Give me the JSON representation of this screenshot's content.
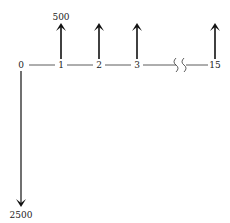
{
  "diagram": {
    "type": "cash-flow timeline",
    "periods": [
      {
        "label": "0",
        "x": 21
      },
      {
        "label": "1",
        "x": 61
      },
      {
        "label": "2",
        "x": 99
      },
      {
        "label": "3",
        "x": 137
      },
      {
        "label": "15",
        "x": 215
      }
    ],
    "inflows": [
      {
        "period": "1",
        "x": 61,
        "amount_label": "500"
      },
      {
        "period": "2",
        "x": 99,
        "amount_label": ""
      },
      {
        "period": "3",
        "x": 137,
        "amount_label": ""
      },
      {
        "period": "15",
        "x": 215,
        "amount_label": ""
      }
    ],
    "outflow": {
      "period": "0",
      "x": 21,
      "amount_label": "2500"
    },
    "break_symbol": "axis-break",
    "colors": {
      "line": "#222222",
      "arrow": "#111111",
      "text": "#222222"
    }
  }
}
